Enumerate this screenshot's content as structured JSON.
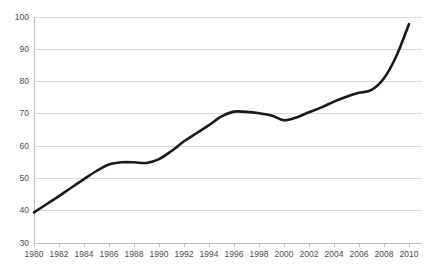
{
  "chart_data": {
    "type": "line",
    "title": "",
    "subtitle": "",
    "xlabel": "",
    "ylabel": "",
    "xlim": [
      1980,
      2010
    ],
    "ylim": [
      30,
      100
    ],
    "grid": true,
    "legend": false,
    "legend_position": "none",
    "line_color": "#1a1a1a",
    "gridline_color": "#d9d9d9",
    "axis_color": "#bfbfbf",
    "tick_label_color": "#4d4d4d",
    "background_color": "#ffffff",
    "y_ticks": [
      30,
      40,
      50,
      60,
      70,
      80,
      90,
      100
    ],
    "y_tick_labels": [
      "30",
      "40",
      "50",
      "60",
      "70",
      "80",
      "90",
      "100"
    ],
    "x_ticks": [
      1980,
      1982,
      1984,
      1986,
      1988,
      1990,
      1992,
      1994,
      1996,
      1998,
      2000,
      2002,
      2004,
      2006,
      2008,
      2010
    ],
    "x_tick_labels": [
      "1980",
      "1982",
      "1984",
      "1986",
      "1988",
      "1990",
      "1992",
      "1994",
      "1996",
      "1998",
      "2000",
      "2002",
      "2004",
      "2006",
      "2008",
      "2010"
    ],
    "x": [
      1980,
      1981,
      1982,
      1983,
      1984,
      1985,
      1986,
      1987,
      1988,
      1989,
      1990,
      1991,
      1992,
      1993,
      1994,
      1995,
      1996,
      1997,
      1998,
      1999,
      2000,
      2001,
      2002,
      2003,
      2004,
      2005,
      2006,
      2007,
      2008,
      2009,
      2010
    ],
    "series": [
      {
        "name": "series-1",
        "color": "#1a1a1a",
        "values": [
          39.5,
          42.0,
          44.5,
          47.2,
          49.8,
          52.3,
          54.3,
          55.0,
          55.0,
          54.8,
          56.0,
          58.5,
          61.5,
          64.0,
          66.5,
          69.2,
          70.7,
          70.6,
          70.2,
          69.5,
          68.0,
          68.9,
          70.5,
          72.0,
          73.8,
          75.3,
          76.5,
          77.4,
          81.0,
          88.0,
          97.8
        ]
      }
    ]
  }
}
